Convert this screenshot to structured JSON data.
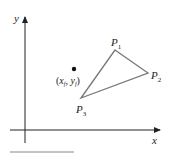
{
  "axes": {
    "x_label": "x",
    "y_label": "y"
  },
  "triangle": {
    "vertices": [
      {
        "name": "P",
        "sub": "1",
        "x": 115,
        "y": 50
      },
      {
        "name": "P",
        "sub": "2",
        "x": 148,
        "y": 73
      },
      {
        "name": "P",
        "sub": "3",
        "x": 81,
        "y": 98
      }
    ],
    "stroke_color": "#777777"
  },
  "point": {
    "label_open": "(",
    "x_label": "x",
    "x_sub": "f",
    "sep": ", ",
    "y_label": "y",
    "y_sub": "f",
    "label_close": ")",
    "x": 74,
    "y": 69
  },
  "colors": {
    "axis": "#222222",
    "underline": "#888888"
  }
}
